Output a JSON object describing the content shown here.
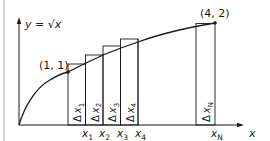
{
  "figure": {
    "function_label": "y = √x",
    "point_start_label": "(1, 1)",
    "point_end_label": "(4, 2)",
    "x_axis_label": "x",
    "delta_labels": [
      "Δ x1",
      "Δ x2",
      "Δ x3",
      "Δ x4",
      "Δ xN"
    ],
    "delta_parts": [
      {
        "delta": "Δ",
        "var": "x",
        "sub": "1"
      },
      {
        "delta": "Δ",
        "var": "x",
        "sub": "2"
      },
      {
        "delta": "Δ",
        "var": "x",
        "sub": "3"
      },
      {
        "delta": "Δ",
        "var": "x",
        "sub": "4"
      },
      {
        "delta": "Δ",
        "var": "x",
        "sub": "N"
      }
    ],
    "tick_labels": [
      {
        "var": "x",
        "sub": "1"
      },
      {
        "var": "x",
        "sub": "2"
      },
      {
        "var": "x",
        "sub": "3"
      },
      {
        "var": "x",
        "sub": "4"
      },
      {
        "var": "x",
        "sub": "N"
      }
    ],
    "colors": {
      "line": "#1a1a1a",
      "frame": "#bdbdbd",
      "background": "#ffffff"
    }
  }
}
